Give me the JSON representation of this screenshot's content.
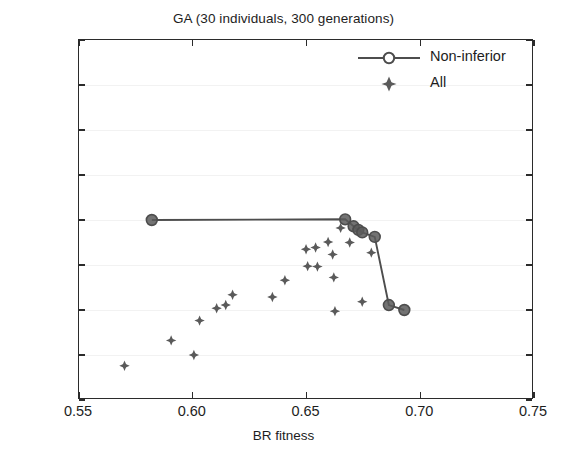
{
  "chart_data": {
    "type": "scatter",
    "title": "GA (30 individuals, 300 generations)",
    "xlabel": "BR fitness",
    "ylabel": "Mlr fitness",
    "xlim": [
      0.55,
      0.75
    ],
    "ylim": [
      0.38,
      0.54
    ],
    "xticks": [
      "0.55",
      "0.60",
      "0.65",
      "0.70",
      "0.75"
    ],
    "xtick_values": [
      0.55,
      0.6,
      0.65,
      0.7,
      0.75
    ],
    "yticks": [
      "0.38",
      "0.40",
      "0.42",
      "0.44",
      "0.46",
      "0.48",
      "0.50",
      "0.52",
      "0.54"
    ],
    "ytick_values": [
      0.38,
      0.4,
      0.42,
      0.44,
      0.46,
      0.48,
      0.5,
      0.52,
      0.54
    ],
    "grid": true,
    "legend_position": "top-right",
    "marker_color": "#5a5a5a",
    "line_color": "#4d4d4d",
    "series": [
      {
        "name": "Non-inferior",
        "marker": "circle",
        "line": true,
        "points": [
          {
            "x": 0.582,
            "y": 0.46
          },
          {
            "x": 0.667,
            "y": 0.4603
          },
          {
            "x": 0.6707,
            "y": 0.4572
          },
          {
            "x": 0.6728,
            "y": 0.4556
          },
          {
            "x": 0.6745,
            "y": 0.4545
          },
          {
            "x": 0.68,
            "y": 0.4525
          },
          {
            "x": 0.6862,
            "y": 0.4222
          },
          {
            "x": 0.693,
            "y": 0.42
          }
        ]
      },
      {
        "name": "All",
        "marker": "diamond",
        "line": false,
        "points": [
          {
            "x": 0.57,
            "y": 0.3952
          },
          {
            "x": 0.5905,
            "y": 0.4065
          },
          {
            "x": 0.6005,
            "y": 0.4
          },
          {
            "x": 0.603,
            "y": 0.4153
          },
          {
            "x": 0.6105,
            "y": 0.4208
          },
          {
            "x": 0.6145,
            "y": 0.4222
          },
          {
            "x": 0.6175,
            "y": 0.4268
          },
          {
            "x": 0.635,
            "y": 0.4258
          },
          {
            "x": 0.6405,
            "y": 0.4332
          },
          {
            "x": 0.6498,
            "y": 0.447
          },
          {
            "x": 0.6505,
            "y": 0.4395
          },
          {
            "x": 0.654,
            "y": 0.4478
          },
          {
            "x": 0.6548,
            "y": 0.4393
          },
          {
            "x": 0.6595,
            "y": 0.4502
          },
          {
            "x": 0.6615,
            "y": 0.4447
          },
          {
            "x": 0.662,
            "y": 0.4345
          },
          {
            "x": 0.6625,
            "y": 0.4195
          },
          {
            "x": 0.665,
            "y": 0.4565
          },
          {
            "x": 0.669,
            "y": 0.45
          },
          {
            "x": 0.6745,
            "y": 0.4237
          },
          {
            "x": 0.6785,
            "y": 0.4455
          }
        ]
      }
    ]
  },
  "legend": {
    "items": [
      {
        "label": "Non-inferior",
        "symbol": "line-circle"
      },
      {
        "label": "All",
        "symbol": "diamond"
      }
    ]
  },
  "caption": ""
}
